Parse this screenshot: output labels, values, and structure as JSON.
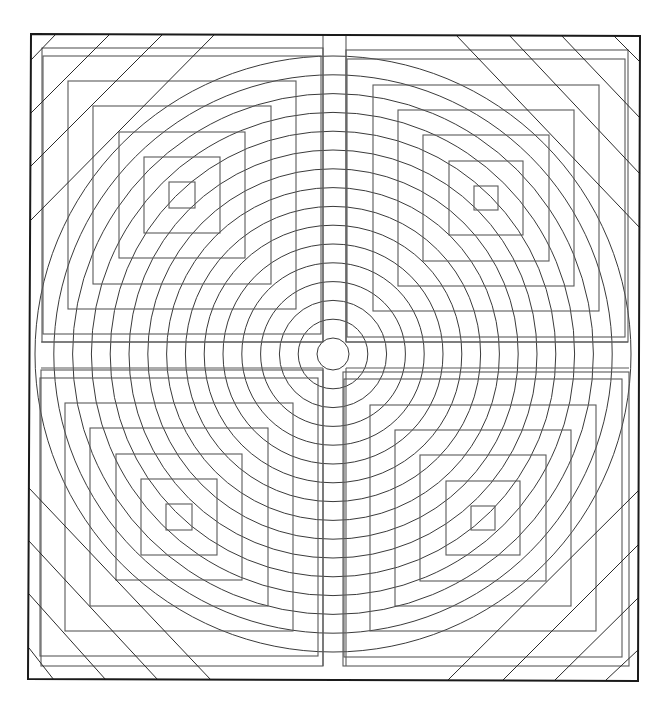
{
  "diagram": {
    "type": "geometric-line-art",
    "canvas": {
      "width": 672,
      "height": 707,
      "background": "#ffffff"
    },
    "colors": {
      "frame": "#1a1a1a",
      "circles": "#3a3a3a",
      "squares": "#5a5a5a",
      "diagonals": "#2a2a2a"
    },
    "frame": {
      "x1": 31,
      "y1": 34,
      "x2": 640,
      "y2": 36,
      "x3": 638,
      "y3": 681,
      "x4": 28,
      "y4": 679
    },
    "center": {
      "cx": 333,
      "cy": 354
    },
    "circles": {
      "count": 16,
      "first_radius": 16,
      "spacing": 18.8
    },
    "axis_gaps": {
      "vertical_left": 323,
      "vertical_right": 346,
      "horizontal_top": 342,
      "horizontal_bottom": 368
    },
    "quadrants": [
      {
        "name": "top-left",
        "cx": 182,
        "cy": 195,
        "sizes": [
          26,
          76,
          126,
          178,
          228,
          278
        ]
      },
      {
        "name": "top-right",
        "cx": 486,
        "cy": 198,
        "sizes": [
          24,
          74,
          126,
          176,
          226,
          278
        ]
      },
      {
        "name": "bottom-left",
        "cx": 179,
        "cy": 517,
        "sizes": [
          26,
          76,
          126,
          178,
          228,
          278
        ]
      },
      {
        "name": "bottom-right",
        "cx": 483,
        "cy": 518,
        "sizes": [
          24,
          74,
          126,
          176,
          226,
          278
        ]
      }
    ],
    "outer_squares": [
      {
        "name": "top-left",
        "x": 42,
        "y": 48,
        "w": 281,
        "h": 294
      },
      {
        "name": "top-right",
        "x": 346,
        "y": 50,
        "w": 282,
        "h": 292
      },
      {
        "name": "bottom-left",
        "x": 41,
        "y": 370,
        "w": 282,
        "h": 296
      },
      {
        "name": "bottom-right",
        "x": 343,
        "y": 372,
        "w": 286,
        "h": 294
      }
    ],
    "corner_diagonals": {
      "top-left": [
        [
          31,
          60,
          56,
          34
        ],
        [
          31,
          113,
          110,
          34
        ],
        [
          31,
          166,
          163,
          34
        ],
        [
          31,
          220,
          215,
          34
        ]
      ],
      "top-right": [
        [
          456,
          35,
          640,
          228
        ],
        [
          509,
          35,
          640,
          174
        ],
        [
          561,
          35,
          640,
          118
        ],
        [
          613,
          35,
          640,
          62
        ]
      ],
      "bottom-left": [
        [
          29,
          488,
          211,
          680
        ],
        [
          29,
          541,
          158,
          680
        ],
        [
          29,
          594,
          106,
          680
        ],
        [
          29,
          648,
          54,
          680
        ]
      ],
      "bottom-right": [
        [
          448,
          680,
          638,
          491
        ],
        [
          503,
          680,
          638,
          545
        ],
        [
          555,
          680,
          638,
          598
        ],
        [
          606,
          680,
          638,
          650
        ]
      ]
    }
  }
}
